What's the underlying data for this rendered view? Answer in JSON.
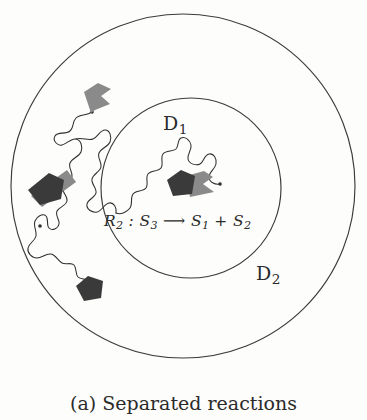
{
  "figure": {
    "caption": "(a) Separated reactions",
    "caption_label": "(a)",
    "caption_text": "Separated reactions"
  },
  "domains": {
    "inner": {
      "name": "D",
      "subscript": "1",
      "label": "D1",
      "role": "inner-subdomain"
    },
    "outer": {
      "name": "D",
      "subscript": "2",
      "label": "D2",
      "role": "outer-subdomain"
    }
  },
  "reaction": {
    "id": "R",
    "id_subscript": "2",
    "separator": " : ",
    "reactant": "S",
    "reactant_subscript": "3",
    "arrow": "⟶",
    "product_1": "S",
    "product_1_subscript": "1",
    "plus": "+",
    "product_2": "S",
    "product_2_subscript": "2",
    "full_text": "R2 : S3 ⟶ S1 + S2"
  },
  "colors": {
    "background": "#fdfdfc",
    "stroke": "#3b3b3b",
    "path_stroke": "#2f2f2f",
    "molecule_dark": "#3a3a3a",
    "molecule_gray": "#8a8a8a",
    "text": "#2b2b2b"
  },
  "geometry": {
    "outer_circle": {
      "cx": 183,
      "cy": 186,
      "r": 172
    },
    "inner_circle": {
      "cx": 191,
      "cy": 188,
      "r": 90
    }
  },
  "molecules": [
    {
      "id": "gray-kite-upper-left",
      "shade": "gray",
      "x": 92,
      "y": 97
    },
    {
      "id": "dark-pentagon-left",
      "shade": "dark",
      "x": 44,
      "y": 188
    },
    {
      "id": "gray-quad-left",
      "shade": "gray",
      "x": 60,
      "y": 182
    },
    {
      "id": "dark-pentagon-lower-left",
      "shade": "dark",
      "x": 88,
      "y": 290
    },
    {
      "id": "dark-pentagon-inner",
      "shade": "dark",
      "x": 182,
      "y": 186
    },
    {
      "id": "gray-kite-inner",
      "shade": "gray",
      "x": 204,
      "y": 183
    }
  ]
}
